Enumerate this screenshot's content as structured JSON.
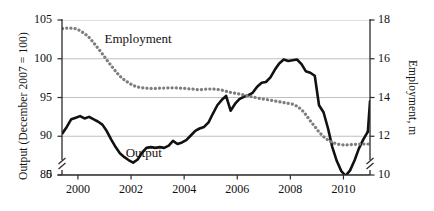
{
  "chart_data": {
    "type": "line",
    "title": "",
    "xlabel": "",
    "ylabel": "Output (December 2007 = 100)",
    "y2label": "Employment, m",
    "grid": true,
    "legend_position": "inline-annotations",
    "xlim": [
      1999.4,
      2011.0
    ],
    "ylim": [
      85,
      105
    ],
    "y2lim": [
      10,
      18
    ],
    "ytick_labels": [
      "105",
      "100",
      "95",
      "90",
      "85",
      "0"
    ],
    "ytick_values": [
      105,
      100,
      95,
      90,
      85,
      0
    ],
    "y2tick_labels": [
      "18",
      "16",
      "14",
      "12",
      "10"
    ],
    "y2tick_values": [
      18,
      16,
      14,
      12,
      10
    ],
    "xtick_labels": [
      "2000",
      "2002",
      "2004",
      "2006",
      "2008",
      "2010"
    ],
    "xtick_values": [
      2000,
      2002,
      2004,
      2006,
      2008,
      2010
    ],
    "axis_break_left": true,
    "axis_break_right": true,
    "annotations": [
      {
        "text": "Employment",
        "x": 2001.0,
        "y": 102.0
      },
      {
        "text": "Output",
        "x": 2001.8,
        "y": 87.3
      }
    ],
    "series": [
      {
        "name": "Output",
        "axis": "left",
        "style": "solid",
        "color": "#111111",
        "width": 2.6,
        "x": [
          1999.42,
          1999.58,
          1999.75,
          1999.92,
          2000.08,
          2000.25,
          2000.42,
          2000.58,
          2000.75,
          2000.92,
          2001.08,
          2001.25,
          2001.42,
          2001.58,
          2001.75,
          2001.92,
          2002.08,
          2002.25,
          2002.42,
          2002.58,
          2002.75,
          2002.92,
          2003.08,
          2003.25,
          2003.42,
          2003.58,
          2003.75,
          2003.92,
          2004.08,
          2004.25,
          2004.42,
          2004.58,
          2004.75,
          2004.92,
          2005.08,
          2005.25,
          2005.42,
          2005.58,
          2005.75,
          2005.92,
          2006.08,
          2006.25,
          2006.42,
          2006.58,
          2006.75,
          2006.92,
          2007.08,
          2007.25,
          2007.42,
          2007.58,
          2007.75,
          2007.92,
          2008.08,
          2008.25,
          2008.42,
          2008.58,
          2008.75,
          2008.92,
          2009.08,
          2009.25,
          2009.42,
          2009.58,
          2009.75,
          2009.92,
          2010.08,
          2010.25,
          2010.42,
          2010.58,
          2010.75,
          2010.92
        ],
        "values": [
          90.4,
          91.2,
          92.2,
          92.4,
          92.6,
          92.3,
          92.5,
          92.2,
          91.9,
          91.5,
          90.7,
          89.6,
          88.6,
          87.8,
          87.3,
          86.9,
          86.6,
          87.0,
          87.9,
          88.5,
          88.6,
          88.5,
          88.6,
          88.5,
          88.8,
          89.4,
          89.0,
          89.2,
          89.5,
          90.1,
          90.7,
          91.0,
          91.2,
          91.8,
          92.9,
          94.0,
          94.7,
          95.2,
          93.3,
          94.2,
          94.8,
          95.1,
          95.3,
          95.6,
          96.4,
          96.9,
          97.0,
          97.6,
          98.6,
          99.4,
          99.9,
          99.7,
          99.8,
          99.9,
          99.3,
          98.4,
          98.2,
          97.8,
          94.0,
          93.1,
          91.0,
          88.6,
          86.8,
          85.5,
          84.9,
          85.6,
          86.9,
          88.4,
          89.6,
          90.6
        ]
      },
      {
        "name": "Output_tail",
        "axis": "left",
        "style": "solid",
        "color": "#111111",
        "width": 2.6,
        "x": [
          2010.92,
          2011.0
        ],
        "values": [
          90.6,
          94.5
        ]
      },
      {
        "name": "Employment",
        "axis": "right",
        "style": "dotted",
        "color": "#7d7d7d",
        "width": 3.2,
        "x": [
          1999.42,
          1999.58,
          1999.75,
          1999.92,
          2000.08,
          2000.25,
          2000.42,
          2000.58,
          2000.75,
          2000.92,
          2001.08,
          2001.25,
          2001.42,
          2001.58,
          2001.75,
          2001.92,
          2002.08,
          2002.25,
          2002.42,
          2002.58,
          2002.75,
          2002.92,
          2003.08,
          2003.25,
          2003.42,
          2003.58,
          2003.75,
          2003.92,
          2004.08,
          2004.25,
          2004.42,
          2004.58,
          2004.75,
          2004.92,
          2005.08,
          2005.25,
          2005.42,
          2005.58,
          2005.75,
          2005.92,
          2006.08,
          2006.25,
          2006.42,
          2006.58,
          2006.75,
          2006.92,
          2007.08,
          2007.25,
          2007.42,
          2007.58,
          2007.75,
          2007.92,
          2008.08,
          2008.25,
          2008.42,
          2008.58,
          2008.75,
          2008.92,
          2009.08,
          2009.25,
          2009.42,
          2009.58,
          2009.75,
          2009.92,
          2010.08,
          2010.25,
          2010.42,
          2010.58,
          2010.75,
          2010.92,
          2011.0
        ],
        "values": [
          17.55,
          17.58,
          17.58,
          17.55,
          17.45,
          17.3,
          17.1,
          16.85,
          16.55,
          16.25,
          15.95,
          15.65,
          15.35,
          15.1,
          14.9,
          14.75,
          14.62,
          14.54,
          14.5,
          14.48,
          14.47,
          14.47,
          14.48,
          14.49,
          14.5,
          14.5,
          14.49,
          14.48,
          14.46,
          14.44,
          14.42,
          14.4,
          14.42,
          14.44,
          14.44,
          14.42,
          14.38,
          14.32,
          14.26,
          14.22,
          14.18,
          14.13,
          14.08,
          14.03,
          13.98,
          13.93,
          13.9,
          13.86,
          13.82,
          13.78,
          13.74,
          13.7,
          13.66,
          13.55,
          13.38,
          13.12,
          12.8,
          12.5,
          12.22,
          11.98,
          11.8,
          11.68,
          11.6,
          11.56,
          11.55,
          11.56,
          11.58,
          11.6,
          11.6,
          11.6,
          11.6
        ]
      }
    ]
  },
  "axes": {
    "left_title": "Output (December 2007 = 100)",
    "right_title": "Employment, m"
  }
}
